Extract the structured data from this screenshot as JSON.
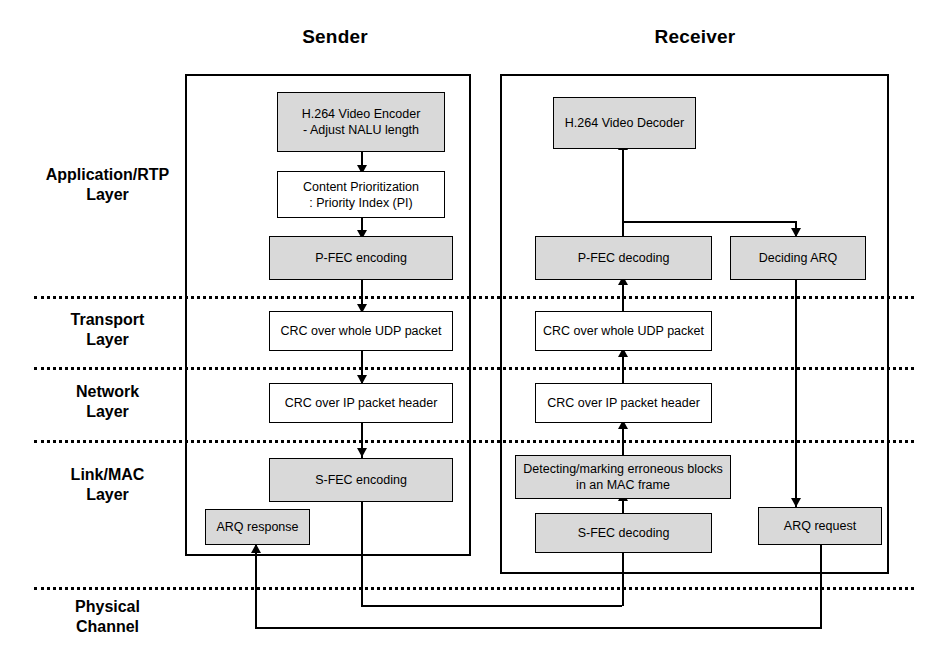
{
  "figure": {
    "columns": [
      {
        "id": "sender",
        "title": "Sender"
      },
      {
        "id": "receiver",
        "title": "Receiver"
      }
    ],
    "layers": [
      {
        "id": "application-rtp",
        "label": "Application/RTP\nLayer"
      },
      {
        "id": "transport",
        "label": "Transport\nLayer"
      },
      {
        "id": "network",
        "label": "Network\nLayer"
      },
      {
        "id": "link-mac",
        "label": "Link/MAC\nLayer"
      },
      {
        "id": "physical",
        "label": "Physical\nChannel"
      }
    ],
    "sender_blocks": [
      {
        "id": "h264-video-encoder",
        "label": "H.264 Video Encoder\n- Adjust NALU length",
        "shaded": true
      },
      {
        "id": "content-prioritization",
        "label": "Content Prioritization\n: Priority Index (PI)",
        "shaded": false
      },
      {
        "id": "p-fec-encoding",
        "label": "P-FEC encoding",
        "shaded": true
      },
      {
        "id": "crc-udp-sender",
        "label": "CRC over whole UDP packet",
        "shaded": false
      },
      {
        "id": "crc-ip-sender",
        "label": "CRC over IP packet header",
        "shaded": false
      },
      {
        "id": "s-fec-encoding",
        "label": "S-FEC encoding",
        "shaded": true
      },
      {
        "id": "arq-response",
        "label": "ARQ response",
        "shaded": true
      }
    ],
    "receiver_blocks": [
      {
        "id": "h264-video-decoder",
        "label": "H.264 Video Decoder",
        "shaded": true
      },
      {
        "id": "p-fec-decoding",
        "label": "P-FEC decoding",
        "shaded": true
      },
      {
        "id": "deciding-arq",
        "label": "Deciding ARQ",
        "shaded": true
      },
      {
        "id": "crc-udp-receiver",
        "label": "CRC over whole UDP packet",
        "shaded": false
      },
      {
        "id": "crc-ip-receiver",
        "label": "CRC over IP packet header",
        "shaded": false
      },
      {
        "id": "detecting-marking",
        "label": "Detecting/marking erroneous blocks\nin an MAC frame",
        "shaded": true
      },
      {
        "id": "s-fec-decoding",
        "label": "S-FEC decoding",
        "shaded": true
      },
      {
        "id": "arq-request",
        "label": "ARQ request",
        "shaded": true
      }
    ],
    "colors": {
      "line": "#000000",
      "box_fill": "#ffffff",
      "box_fill_shaded": "#d9d9d9",
      "background": "#ffffff"
    }
  }
}
